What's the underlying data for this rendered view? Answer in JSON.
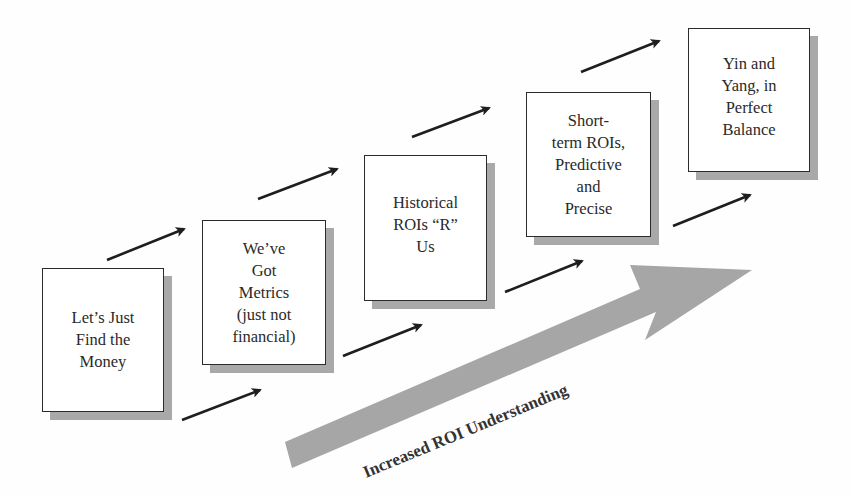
{
  "diagram": {
    "stages": [
      {
        "label": "Let’s Just\nFind the\nMoney"
      },
      {
        "label": "We’ve\nGot\nMetrics\n(just not\nfinancial)"
      },
      {
        "label": "Historical\nROIs “R”\nUs"
      },
      {
        "label": "Short-\nterm ROIs,\nPredictive\nand\nPrecise"
      },
      {
        "label": "Yin and\nYang, in\nPerfect\nBalance"
      }
    ],
    "progress_arrow": {
      "label": "Increased ROI Understanding",
      "color": "#a6a6a6"
    },
    "colors": {
      "box_border": "#2b2b2b",
      "box_shadow": "#a9a9a9",
      "arrow": "#1e1e1e"
    }
  }
}
